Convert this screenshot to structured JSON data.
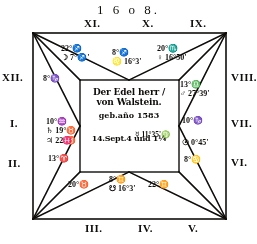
{
  "year": "1 6 o 8.",
  "houses": {
    "xi": "XI.",
    "x": "X.",
    "ix": "IX.",
    "xii": "XII.",
    "i": "I.",
    "ii": "II.",
    "viii": "VIII.",
    "vii": "VII.",
    "vi": "VI.",
    "iii": "III.",
    "iv": "IV.",
    "v": "V."
  },
  "cusps": {
    "xi": {
      "cusp": "22°♐",
      "body": "☽ 7°♐'"
    },
    "x": {
      "cusp": "8°♐",
      "body": "♌ 16°3'"
    },
    "ix": {
      "cusp": "20°♏",
      "body": "♀ 16°50'"
    },
    "viii": {
      "cusp": "13°♎",
      "body": "♂ 27°39'"
    },
    "vii": {
      "cusp": "10°♑",
      "body": ""
    },
    "vi": {
      "cusp": "8°♋",
      "body": ""
    },
    "v": {
      "cusp": "22°♊",
      "body": ""
    },
    "iv": {
      "cusp": "8°♊",
      "body": "☋ 16°3'"
    },
    "iii": {
      "cusp": "20°♉",
      "body": ""
    },
    "ii": {
      "cusp": "13°♈",
      "body": ""
    },
    "i": {
      "cusp": "10°♒",
      "body": "♄ 19°♉",
      "body2": "♃ 22°♉"
    },
    "xii": {
      "cusp": "8°♑",
      "body": ""
    }
  },
  "planets": {
    "mercury": "☿ 11°35'♍",
    "sun": "☉ 0°45'",
    "pisces_glyph": "♓"
  },
  "center": {
    "line1": "Der Edel herr /",
    "line2": "von Walstein.",
    "line3": "geb.año 1583",
    "line4": "14.Sept.4 und 1¼"
  },
  "colors": {
    "ink": "#141210",
    "paper": "#ffffff"
  }
}
